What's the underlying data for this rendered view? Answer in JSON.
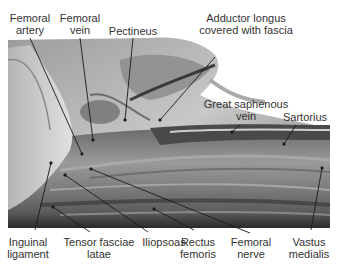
{
  "figure": {
    "colors": {
      "background": "#ffffff",
      "label_text": "#333333",
      "leader_line": "#1a1a1a"
    }
  },
  "labels": {
    "femoral_artery": {
      "line1": "Femoral",
      "line2": "artery"
    },
    "femoral_vein": {
      "line1": "Femoral",
      "line2": "vein"
    },
    "pectineus": {
      "line1": "Pectineus"
    },
    "adductor_longus": {
      "line1": "Adductor longus",
      "line2": "covered with fascia"
    },
    "great_saphenous_vein": {
      "line1": "Great saphenous",
      "line2": "vein"
    },
    "sartorius": {
      "line1": "Sartorius"
    },
    "inguinal_ligament": {
      "line1": "Inguinal",
      "line2": "ligament"
    },
    "tensor_fasciae_latae": {
      "line1": "Tensor fasciae",
      "line2": "latae"
    },
    "iliopsoas": {
      "line1": "Iliopsoas"
    },
    "rectus_femoris": {
      "line1": "Rectus",
      "line2": "femoris"
    },
    "femoral_nerve": {
      "line1": "Femoral",
      "line2": "nerve"
    },
    "vastus_medialis": {
      "line1": "Vastus",
      "line2": "medialis"
    }
  }
}
